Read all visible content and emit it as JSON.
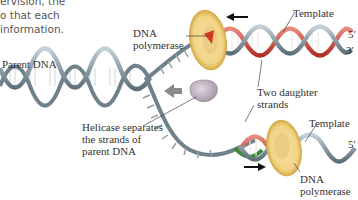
{
  "intro_text": {
    "lines": [
      "ervision, the",
      "o that each",
      "information."
    ]
  },
  "labels": {
    "parent_dna": "Parent DNA",
    "dna_polymerase_top": [
      "DNA",
      "polymerase"
    ],
    "template_top": "Template",
    "prime_top_5": "5′",
    "prime_top_3": "3′",
    "two_daughter_strands": [
      "Two daughter",
      "strands"
    ],
    "helicase": [
      "Helicase separates",
      "the strands of",
      "parent DNA"
    ],
    "template_bottom": "Template",
    "prime_bottom_5": "5′",
    "dna_polymerase_bottom": [
      "DNA",
      "polymerase"
    ]
  },
  "colors": {
    "parent_strand": "#8e9fa8",
    "parent_strand_dark": "#5d6f78",
    "new_strand_red": "#c0392b",
    "new_strand_green": "#3a8a3a",
    "polymerase_fill": "#f2d98c",
    "polymerase_edge": "#d9b24c",
    "helicase_fill": "#c7b6c6",
    "arrow": "#111111",
    "helicase_arrow": "#8a8a8a"
  }
}
